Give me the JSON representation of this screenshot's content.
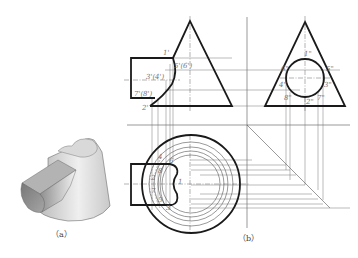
{
  "figure": {
    "caption_a": "（a）",
    "caption_b": "（b）"
  },
  "front_view": {
    "labels": {
      "p1": "1'",
      "p2": "2'",
      "p34": "3'(4')",
      "p56": "5'(6')",
      "p78": "7'(8')"
    }
  },
  "side_view": {
    "labels": {
      "p1": "1\"",
      "p2": "2\"",
      "p3": "3\"",
      "p4": "4\"",
      "p5": "5\"",
      "p6": "6\"",
      "p7": "7\"",
      "p8": "8\""
    }
  },
  "top_view": {
    "labels": {
      "p1": "1",
      "p2": "2",
      "p3": "3",
      "p4": "4",
      "p5": "5",
      "p6": "6",
      "p7": "7",
      "p8": "8"
    }
  },
  "colors": {
    "outline": "#1a1a1a",
    "construction": "#666666",
    "label": "#777777",
    "shade_dark": "#8a8a8a",
    "shade_light": "#e6e6e6"
  }
}
